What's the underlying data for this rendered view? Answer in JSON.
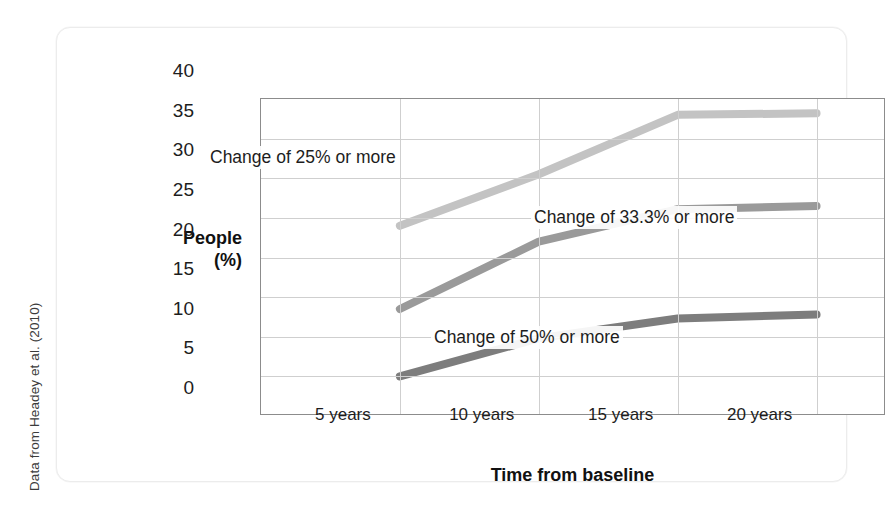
{
  "source_credit": "Data from Headey et al. (2010)",
  "axes": {
    "y_title_line1": "People",
    "y_title_line2": "(%)",
    "x_title": "Time from baseline",
    "y_ticks": [
      "0",
      "5",
      "10",
      "15",
      "20",
      "25",
      "30",
      "35",
      "40"
    ],
    "x_ticks": [
      "5 years",
      "10 years",
      "15 years",
      "20 years"
    ]
  },
  "annotations": [
    {
      "id": "ann-25",
      "text": "Change of 25% or more"
    },
    {
      "id": "ann-333",
      "text": "Change of 33.3% or more"
    },
    {
      "id": "ann-50",
      "text": "Change of 50% or more"
    }
  ],
  "colors": {
    "series_25": "#c3c3c3",
    "series_333": "#9a9a9a",
    "series_50": "#7d7d7d",
    "grid": "#cfcfcf",
    "frame": "#8c8c8c",
    "text": "#1d1d1d",
    "card_border": "#ececec"
  },
  "chart_data": {
    "type": "line",
    "title": "",
    "xlabel": "Time from baseline",
    "ylabel": "People (%)",
    "categories": [
      "5 years",
      "10 years",
      "15 years",
      "20 years"
    ],
    "x": [
      5,
      10,
      15,
      20
    ],
    "ylim": [
      0,
      40
    ],
    "xlim": [
      0,
      22.5
    ],
    "yticks": [
      0,
      5,
      10,
      15,
      20,
      25,
      30,
      35,
      40
    ],
    "grid": true,
    "legend": "inline-annotations",
    "series": [
      {
        "name": "Change of 25% or more",
        "color": "#c3c3c3",
        "values": [
          24.0,
          30.5,
          38.0,
          38.2
        ]
      },
      {
        "name": "Change of 33.3% or more",
        "color": "#9a9a9a",
        "values": [
          13.5,
          22.0,
          26.1,
          26.5
        ]
      },
      {
        "name": "Change of 50% or more",
        "color": "#7d7d7d",
        "values": [
          5.0,
          9.8,
          12.3,
          12.8
        ]
      }
    ]
  }
}
